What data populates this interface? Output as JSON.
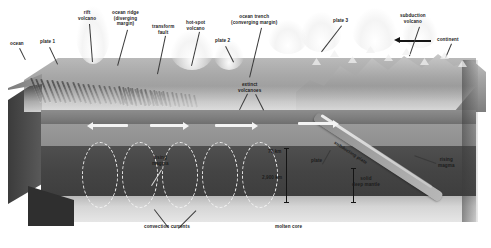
{
  "diagram": {
    "type": "cross-section block diagram",
    "colors": {
      "crust": "#8d8d8d",
      "upper_mantle": "#9a9a9a",
      "deep_mantle": "#444444",
      "molten_core": "#d5d5d5",
      "arrow_white": "#f4f4f4",
      "arrow_black": "#161616",
      "label_dark": "#1c1c1c",
      "label_light": "#e9e9e9"
    },
    "labels": {
      "ocean": "ocean",
      "plate1": "plate 1",
      "rift_volcano": "rift\nvolcano",
      "ocean_ridge": "ocean ridge\n(diverging\nmargin)",
      "transform_fault": "transform\nfault",
      "hotspot_volcano": "hot-spot\nvolcano",
      "plate2": "plate 2",
      "ocean_trench": "ocean trench\n(converging margin)",
      "plate3": "plate 3",
      "subduction_volcano": "subduction\nvolcano",
      "continent": "continent",
      "extinct_volcanoes": "extinct\nvolcanoes",
      "rising_magma_left": "rising\nmagma",
      "rising_magma_right": "rising\nmagma",
      "depth_70km": "70 km",
      "depth_2900km": "2,900 km",
      "plate": "plate",
      "solid_deep_mantle": "solid\ndeep mantle",
      "subducting_plate": "subducting plate",
      "convection_currents": "convection currents",
      "molten_core": "molten core"
    },
    "depth_scale": {
      "lithosphere_base": "70 km",
      "core_mantle_boundary": "2,900 km"
    },
    "motion_arrows": [
      {
        "id": "plate1-left",
        "direction": "left",
        "meaning": "plate 1 spreading west"
      },
      {
        "id": "plate1-right",
        "direction": "right",
        "meaning": "plate 1 spreading east"
      },
      {
        "id": "plate2-right",
        "direction": "right",
        "meaning": "plate 2 moving east"
      },
      {
        "id": "plate2-east",
        "direction": "right",
        "meaning": "plate 2 toward trench"
      },
      {
        "id": "plate3-west",
        "direction": "right",
        "meaning": "plate 3 overriding"
      },
      {
        "id": "continent",
        "direction": "left",
        "meaning": "continent drift direction"
      }
    ]
  }
}
